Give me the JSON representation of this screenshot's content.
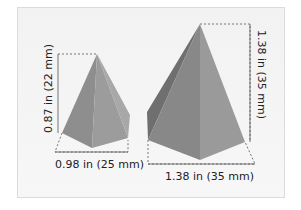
{
  "diagram": {
    "small_pyramid": {
      "height_label": "0.87 in (22 mm)",
      "width_label": "0.98 in (25 mm)"
    },
    "large_pyramid": {
      "height_label": "1.38 in (35 mm)",
      "width_label": "1.38 in (35 mm)"
    },
    "colors": {
      "face_light": "#9a9a9a",
      "face_mid": "#8a8a8a",
      "face_dark": "#6f6f6f",
      "background": "#f3f3f3"
    }
  }
}
